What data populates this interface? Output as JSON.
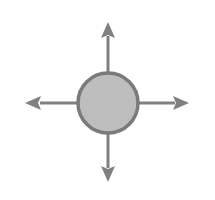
{
  "diagram": {
    "type": "radial-arrows",
    "colors": {
      "background": "#ffffff",
      "circle_fill": "#bdbdbd",
      "circle_stroke": "#7a7a7a",
      "arrow": "#808080"
    },
    "center": {
      "x": 108,
      "y": 103,
      "radius": 31
    },
    "arrows": [
      {
        "direction": "up",
        "from": [
          108,
          72
        ],
        "to": [
          108,
          22
        ]
      },
      {
        "direction": "down",
        "from": [
          108,
          134
        ],
        "to": [
          108,
          182
        ]
      },
      {
        "direction": "left",
        "from": [
          77,
          103
        ],
        "to": [
          25,
          103
        ]
      },
      {
        "direction": "right",
        "from": [
          139,
          103
        ],
        "to": [
          189,
          103
        ]
      }
    ]
  }
}
